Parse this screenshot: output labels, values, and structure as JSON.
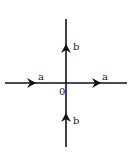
{
  "diagram": {
    "type": "path-diagram",
    "origin": {
      "label": "0",
      "x": 66,
      "y": 83
    },
    "axes": {
      "horizontal": {
        "x1": 5,
        "x2": 127,
        "y": 83
      },
      "vertical": {
        "x": 66,
        "y1": 19,
        "y2": 147
      }
    },
    "arrows": [
      {
        "id": "left-a",
        "label": "a",
        "direction": "right",
        "x": 33,
        "y": 83,
        "label_x": 38,
        "label_y": 80
      },
      {
        "id": "right-a",
        "label": "a",
        "direction": "right",
        "x": 98,
        "y": 83,
        "label_x": 102,
        "label_y": 80
      },
      {
        "id": "upper-b",
        "label": "b",
        "direction": "up",
        "x": 66,
        "y": 48,
        "label_x": 73,
        "label_y": 50
      },
      {
        "id": "lower-b",
        "label": "b",
        "direction": "up",
        "x": 66,
        "y": 117,
        "label_x": 73,
        "label_y": 124
      }
    ],
    "stroke_color": "#111111",
    "background": "#ffffff"
  }
}
